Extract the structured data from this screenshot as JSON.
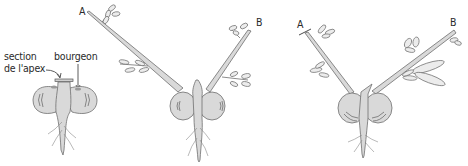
{
  "figure": {
    "colors": {
      "fill": "#d9d9d9",
      "stroke": "#6e6e6e",
      "text": "#2a2a2a",
      "background": "#ffffff"
    },
    "panels": [
      {
        "id": "panel-1",
        "labels": {
          "section": "section\nde l'apex",
          "section_line1": "section",
          "section_line2": "de l'apex",
          "bud": "bourgeon"
        }
      },
      {
        "id": "panel-2",
        "labels": {
          "branch_a": "A",
          "branch_b": "B"
        }
      },
      {
        "id": "panel-3",
        "labels": {
          "branch_a": "A",
          "branch_b": "B"
        }
      }
    ]
  }
}
